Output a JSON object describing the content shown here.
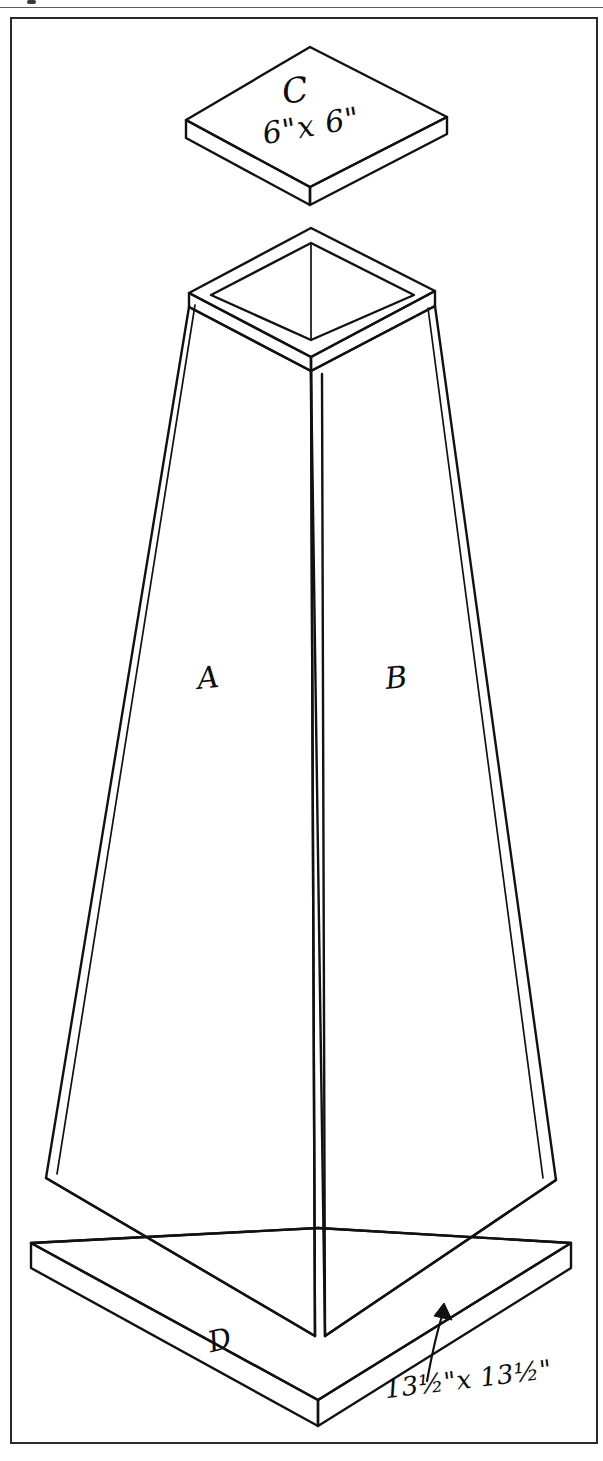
{
  "page": {
    "background_color": "#ffffff",
    "ink_color": "#111111",
    "frame": {
      "name": "page-border",
      "visible": true
    }
  },
  "drawing": {
    "type": "isometric-exploded-assembly",
    "subject": "tapered four-sided obelisk planter",
    "parts": [
      {
        "id": "C",
        "label": "C",
        "dimension": "6\"x 6\"",
        "dimension_parts": {
          "whole_1": "6",
          "unit_1": "\"",
          "times": "x",
          "whole_2": "6",
          "unit_2": "\""
        },
        "description": "square top cap board shown floating above the obelisk"
      },
      {
        "id": "A",
        "label": "A",
        "description": "left visible tapered side panel"
      },
      {
        "id": "B",
        "label": "B",
        "description": "right visible tapered side panel"
      },
      {
        "id": "D",
        "label": "D",
        "dimension": "13½\"x 13½\"",
        "dimension_parts": {
          "whole_1": "13",
          "frac_1": "½",
          "unit_1": "\"",
          "times": "x",
          "whole_2": "13",
          "frac_2": "½",
          "unit_2": "\""
        },
        "description": "square base board with leader arrow pointing to its front-right edge"
      }
    ],
    "annotations": {
      "cap_label": "C",
      "cap_dimension_text": "6\"x 6\"",
      "left_panel_label": "A",
      "right_panel_label": "B",
      "base_label": "D",
      "base_dimension_text": "13½\"x 13½\""
    }
  }
}
